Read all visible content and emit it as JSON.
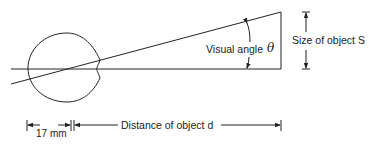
{
  "diagram": {
    "labels": {
      "visual_angle": "Visual angle",
      "theta": "θ",
      "size": "Size of object S",
      "distance": "Distance of object d",
      "eye_length": "17 mm"
    },
    "colors": {
      "line": "#222222",
      "background": "#ffffff"
    }
  }
}
